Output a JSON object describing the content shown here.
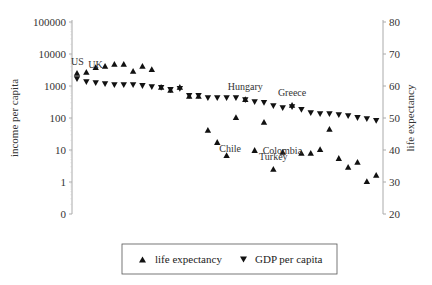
{
  "chart_data": {
    "type": "scatter",
    "title": "",
    "xlabel": "",
    "ylabel_left": "income per capita",
    "ylabel_right": "life expectancy",
    "left_axis": {
      "scale": "log",
      "ticks": [
        0,
        1,
        10,
        100,
        1000,
        10000,
        100000
      ],
      "tick_labels": [
        "0",
        "1",
        "10",
        "100",
        "1000",
        "10000",
        "100000"
      ]
    },
    "right_axis": {
      "scale": "linear",
      "range": [
        20,
        80
      ],
      "ticks": [
        20,
        30,
        40,
        50,
        60,
        70,
        80
      ],
      "tick_labels": [
        "20",
        "30",
        "40",
        "50",
        "60",
        "70",
        "80"
      ]
    },
    "grid": false,
    "legend_position": "bottom",
    "x_count": 33,
    "series": [
      {
        "name": "life expectancy",
        "marker": "triangle-up",
        "axis": "right",
        "values": [
          64.1,
          64.4,
          65.9,
          66.3,
          66.9,
          66.9,
          64.7,
          66.3,
          65.3,
          59.7,
          58.8,
          59.7,
          56.9,
          56.9,
          46.3,
          42.5,
          38.4,
          50.3,
          55.9,
          40.0,
          48.8,
          34.1,
          39.4,
          54.1,
          39.1,
          39.1,
          40.3,
          46.6,
          37.5,
          34.7,
          36.3,
          30.3,
          32.2
        ]
      },
      {
        "name": "GDP per capita",
        "marker": "triangle-down",
        "axis": "left",
        "values": [
          1650,
          1330,
          1230,
          1150,
          1070,
          1070,
          1070,
          1000,
          930,
          870,
          750,
          810,
          490,
          490,
          420,
          420,
          420,
          420,
          365,
          316,
          295,
          237,
          205,
          220,
          178,
          143,
          133,
          133,
          124,
          115,
          100,
          93,
          81
        ]
      }
    ],
    "annotations": [
      {
        "text": "US",
        "index": 0,
        "series": "life expectancy",
        "placement": "above-left"
      },
      {
        "text": "UK",
        "index": 1,
        "series": "life expectancy",
        "placement": "left"
      },
      {
        "text": "Hungary",
        "index": 18,
        "series": "life expectancy",
        "placement": "above"
      },
      {
        "text": "Chile",
        "index": 15,
        "series": "life expectancy",
        "placement": "below-right"
      },
      {
        "text": "Colombia",
        "index": 19,
        "series": "life expectancy",
        "placement": "right"
      },
      {
        "text": "Turkey",
        "index": 21,
        "series": "life expectancy",
        "placement": "above"
      },
      {
        "text": "Greece",
        "index": 23,
        "series": "life expectancy",
        "placement": "above"
      }
    ],
    "legend": [
      "life expectancy",
      "GDP per capita"
    ]
  }
}
